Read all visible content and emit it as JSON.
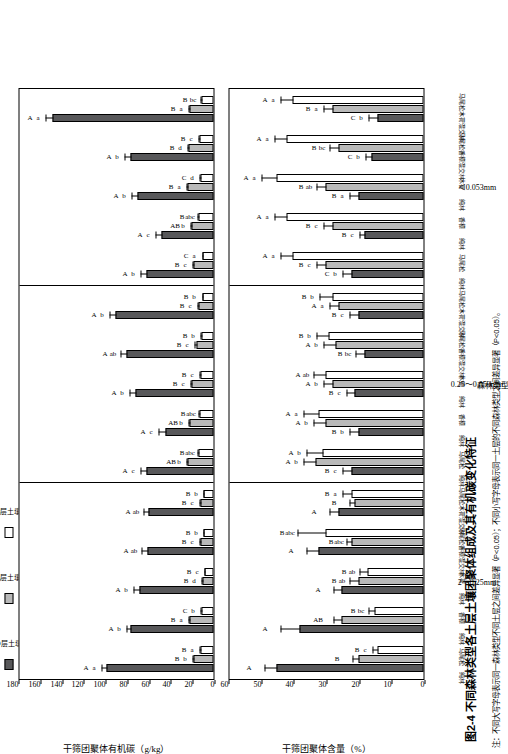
{
  "figure": {
    "title": "图2-4  不同森林类型各土层土壤团聚体组成及其有机碳变化特征",
    "note": "注：不同大写字母表示同一森林类型不同土层之间差异显著（P<0.05）；不同小写字母表示同一土层的不同森林类型之间差异显著（P<0.05）。",
    "xlabel": "森林类型"
  },
  "legend": {
    "items": [
      {
        "key": "O",
        "label": "O层土壤",
        "color": "#58585a"
      },
      {
        "key": "A",
        "label": "A层土壤",
        "color": "#b9b9b9"
      },
      {
        "key": "B",
        "label": "B层土壤",
        "color": "#ffffff"
      }
    ]
  },
  "categories": [
    "马尾松\n纯林",
    "香樟\n纯林",
    "木荷\n纯林",
    "马尾松 ×\n香樟混交林",
    "马尾松 ×\n木荷混交林"
  ],
  "panel_labels": [
    "2～0.25mm",
    "0.25～0.053mm",
    "＜0.053mm"
  ],
  "chart_data": [
    {
      "type": "bar",
      "id": "top",
      "title": "",
      "ylabel": "干筛团聚体有机碳（g/kg）",
      "xlabel": "森林类型",
      "ylim": [
        0,
        180
      ],
      "yticks": [
        0,
        20,
        40,
        60,
        80,
        100,
        120,
        140,
        160,
        180
      ],
      "grid": false,
      "legend_position": "top-left",
      "panels": [
        {
          "label": "2～0.25mm",
          "categories": [
            "马尾松纯林",
            "香樟纯林",
            "木荷纯林",
            "马尾松 × 香樟混交林",
            "马尾松 × 木荷混交林"
          ],
          "series": [
            {
              "name": "O层土壤",
              "values": [
                98,
                76,
                68,
                61,
                60
              ],
              "errors": [
                6,
                5,
                6,
                6,
                5
              ],
              "upper_letters": [
                "A",
                "A",
                "A",
                "A",
                "A"
              ],
              "lower_letters": [
                "a",
                "b",
                "b",
                "ab",
                "ab"
              ]
            },
            {
              "name": "A层土壤",
              "values": [
                18,
                22,
                10,
                12,
                12
              ],
              "errors": [
                2,
                2,
                2,
                2,
                2
              ],
              "upper_letters": [
                "B",
                "B",
                "B",
                "B",
                "B"
              ],
              "lower_letters": [
                "b",
                "a",
                "d",
                "c",
                "c"
              ]
            },
            {
              "name": "B层土壤",
              "values": [
                12,
                11,
                8,
                9,
                9
              ],
              "errors": [
                1.5,
                1.5,
                1.5,
                1.5,
                1.5
              ],
              "upper_letters": [
                "B",
                "C",
                "B",
                "B",
                "B"
              ],
              "lower_letters": [
                "a",
                "b",
                "c",
                "b",
                "b"
              ]
            }
          ]
        },
        {
          "label": "0.25～0.053mm",
          "categories": [
            "马尾松纯林",
            "香樟纯林",
            "木荷纯林",
            "马尾松 × 香樟混交林",
            "马尾松 × 木荷混交林"
          ],
          "series": [
            {
              "name": "O层土壤",
              "values": [
                62,
                44,
                72,
                80,
                90
              ],
              "errors": [
                6,
                7,
                6,
                6,
                6
              ],
              "upper_letters": [
                "A",
                "A",
                "A",
                "A",
                "A"
              ],
              "lower_letters": [
                "c",
                "c",
                "b",
                "ab",
                "b"
              ]
            },
            {
              "name": "A层土壤",
              "values": [
                24,
                22,
                20,
                16,
                14
              ],
              "errors": [
                2,
                2,
                2,
                2,
                2
              ],
              "upper_letters": [
                "AB",
                "AB",
                "B",
                "B",
                "B"
              ],
              "lower_letters": [
                "b",
                "b",
                "c",
                "c",
                "c"
              ]
            },
            {
              "name": "B层土壤",
              "values": [
                14,
                13,
                12,
                11,
                10
              ],
              "errors": [
                1.5,
                1.5,
                1.5,
                1.5,
                1.5
              ],
              "upper_letters": [
                "B",
                "B",
                "B",
                "B",
                "B"
              ],
              "lower_letters": [
                "abc",
                "abc",
                "c",
                "b",
                "b"
              ]
            }
          ]
        },
        {
          "label": "＜0.053mm",
          "categories": [
            "马尾松纯林",
            "香樟纯林",
            "木荷纯林",
            "马尾松 × 香樟混交林",
            "马尾松 × 木荷混交林"
          ],
          "series": [
            {
              "name": "O层土壤",
              "values": [
                62,
                48,
                70,
                76,
                148
              ],
              "errors": [
                6,
                6,
                6,
                7,
                7
              ],
              "upper_letters": [
                "A",
                "A",
                "A",
                "A",
                "A"
              ],
              "lower_letters": [
                "b",
                "c",
                "b",
                "b",
                "a"
              ]
            },
            {
              "name": "A层土壤",
              "values": [
                18,
                20,
                24,
                23,
                22
              ],
              "errors": [
                2,
                2,
                2,
                2,
                2
              ],
              "upper_letters": [
                "B",
                "AB",
                "B",
                "B",
                "B"
              ],
              "lower_letters": [
                "c",
                "b",
                "a",
                "d",
                "a"
              ]
            },
            {
              "name": "B层土壤",
              "values": [
                10,
                14,
                12,
                13,
                11
              ],
              "errors": [
                1.5,
                1.5,
                1.5,
                1.5,
                1.5
              ],
              "upper_letters": [
                "C",
                "B",
                "C",
                "B",
                "B"
              ],
              "lower_letters": [
                "a",
                "abc",
                "d",
                "c",
                "bc"
              ]
            }
          ]
        }
      ]
    },
    {
      "type": "bar",
      "id": "bottom",
      "title": "",
      "ylabel": "干筛团聚体含量（%）",
      "xlabel": "森林类型",
      "ylim": [
        0,
        60
      ],
      "yticks": [
        0,
        10,
        20,
        30,
        40,
        50,
        60
      ],
      "grid": false,
      "legend_position": "top-left",
      "panels": [
        {
          "label": "2～0.25mm",
          "categories": [
            "马尾松纯林",
            "香樟纯林",
            "木荷纯林",
            "马尾松 × 香樟混交林",
            "马尾松 × 木荷混交林"
          ],
          "series": [
            {
              "name": "O层土壤",
              "values": [
                45,
                38,
                25,
                32,
                26
              ],
              "errors": [
                4,
                6,
                3,
                4,
                3
              ],
              "upper_letters": [
                "A",
                "A",
                "A",
                "A",
                "A"
              ],
              "lower_letters": [
                "",
                "",
                "",
                "",
                ""
              ]
            },
            {
              "name": "A层土壤",
              "values": [
                20,
                25,
                20,
                22,
                21
              ],
              "errors": [
                2,
                3,
                3,
                2,
                2
              ],
              "upper_letters": [
                "B",
                "AB",
                "B",
                "B",
                "B"
              ],
              "lower_letters": [
                "",
                "",
                "ab",
                "abc",
                ""
              ]
            },
            {
              "name": "B层土壤",
              "values": [
                14,
                15,
                17,
                30,
                22
              ],
              "errors": [
                2,
                2,
                3,
                9,
                3
              ],
              "upper_letters": [
                "B",
                "B",
                "B",
                "B",
                "B"
              ],
              "lower_letters": [
                "c",
                "bc",
                "ab",
                "abc",
                "a"
              ]
            }
          ]
        },
        {
          "label": "0.25～0.053mm",
          "categories": [
            "马尾松纯林",
            "香樟纯林",
            "木荷纯林",
            "马尾松 × 香樟混交林",
            "马尾松 × 木荷混交林"
          ],
          "series": [
            {
              "name": "O层土壤",
              "values": [
                22,
                20,
                21,
                18,
                20
              ],
              "errors": [
                3,
                3,
                3,
                3,
                3
              ],
              "upper_letters": [
                "B",
                "B",
                "B",
                "B",
                "B"
              ],
              "lower_letters": [
                "c",
                "b",
                "c",
                "bc",
                "c"
              ]
            },
            {
              "name": "A层土壤",
              "values": [
                33,
                30,
                28,
                27,
                26
              ],
              "errors": [
                4,
                4,
                3,
                4,
                3
              ],
              "upper_letters": [
                "A",
                "A",
                "A",
                "A",
                "A"
              ],
              "lower_letters": [
                "b",
                "b",
                "b",
                "b",
                "a"
              ]
            },
            {
              "name": "B层土壤",
              "values": [
                31,
                32,
                30,
                29,
                28
              ],
              "errors": [
                5,
                5,
                4,
                4,
                4
              ],
              "upper_letters": [
                "A",
                "A",
                "A",
                "B",
                "B"
              ],
              "lower_letters": [
                "b",
                "a",
                "ab",
                "b",
                "b"
              ]
            }
          ]
        },
        {
          "label": "＜0.053mm",
          "categories": [
            "马尾松纯林",
            "香樟纯林",
            "木荷纯林",
            "马尾松 × 香樟混交林",
            "马尾松 × 木荷混交林"
          ],
          "series": [
            {
              "name": "O层土壤",
              "values": [
                22,
                18,
                20,
                16,
                14
              ],
              "errors": [
                3,
                2,
                3,
                2,
                3
              ],
              "upper_letters": [
                "C",
                "B",
                "B",
                "C",
                "C"
              ],
              "lower_letters": [
                "b",
                "c",
                "a",
                "b",
                "b"
              ]
            },
            {
              "name": "A层土壤",
              "values": [
                30,
                28,
                30,
                26,
                28
              ],
              "errors": [
                3,
                3,
                3,
                3,
                3
              ],
              "upper_letters": [
                "B",
                "B",
                "B",
                "B",
                "B"
              ],
              "lower_letters": [
                "c",
                "c",
                "ab",
                "bc",
                "a"
              ]
            },
            {
              "name": "B层土壤",
              "values": [
                40,
                42,
                45,
                42,
                40
              ],
              "errors": [
                4,
                4,
                5,
                4,
                4
              ],
              "upper_letters": [
                "A",
                "A",
                "A",
                "A",
                "A"
              ],
              "lower_letters": [
                "a",
                "a",
                "a",
                "a",
                "a"
              ]
            }
          ]
        }
      ]
    }
  ]
}
